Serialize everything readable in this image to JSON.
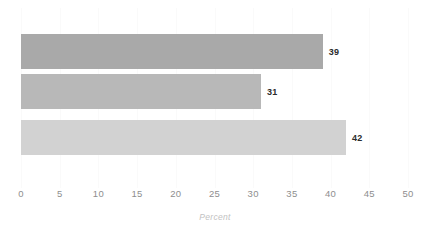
{
  "chart_data": {
    "type": "bar",
    "orientation": "horizontal",
    "title": "",
    "subtitle": "",
    "xlabel": "Percent",
    "ylabel": "",
    "xlim": [
      0,
      50
    ],
    "xticks": [
      0,
      5,
      10,
      15,
      20,
      25,
      30,
      35,
      40,
      45,
      50
    ],
    "xtick_labels": [
      "0",
      "5",
      "10",
      "15",
      "20",
      "25",
      "30",
      "35",
      "40",
      "45",
      "50"
    ],
    "grid": true,
    "grid_axis": "x",
    "legend": false,
    "categories": [
      "",
      "",
      ""
    ],
    "values": [
      39,
      31,
      42
    ],
    "data_labels": [
      "39",
      "31",
      "42"
    ],
    "bar_colors": [
      "#a9a9a9",
      "#b8b8b8",
      "#d2d2d2"
    ],
    "series": [
      {
        "name": "",
        "values": [
          39,
          31,
          42
        ]
      }
    ],
    "bars": [
      {
        "value": 39,
        "label": "39",
        "color": "#a9a9a9"
      },
      {
        "value": 31,
        "label": "31",
        "color": "#b8b8b8"
      },
      {
        "value": 42,
        "label": "42",
        "color": "#d2d2d2"
      }
    ]
  },
  "style": {
    "background": "#ffffff",
    "gridline_color": "#fafafa",
    "tick_label_color": "#8e8e8e",
    "axis_title_color": "#c2c2c2",
    "data_label_color": "#2b2b2b"
  }
}
